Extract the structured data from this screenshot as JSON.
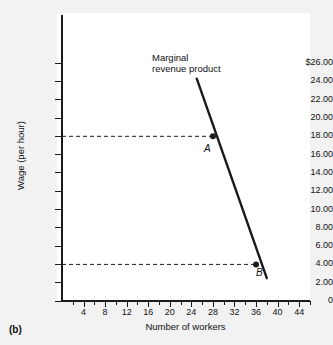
{
  "figure": {
    "caption": "(b)"
  },
  "chart_data": {
    "type": "line",
    "title": "",
    "xlabel": "Number of workers",
    "ylabel": "Wage (per hour)",
    "xlim": [
      0,
      46
    ],
    "ylim": [
      0,
      27
    ],
    "grid": false,
    "legend_position": "inline-annotation",
    "series": [
      {
        "name": "Marginal revenue product",
        "x": [
          25,
          38
        ],
        "y": [
          24.3,
          2.5
        ],
        "color": "#1a1a1a"
      }
    ],
    "points": [
      {
        "label": "A",
        "x": 28,
        "y": 18.0
      },
      {
        "label": "B",
        "x": 36,
        "y": 4.0
      }
    ],
    "annotations": [
      {
        "name": "curve-label",
        "line1": "Marginal",
        "line2": "revenue product"
      }
    ],
    "reference_lines": [
      {
        "name": "wage-18-dashed",
        "orientation": "horizontal",
        "y": 18.0
      },
      {
        "name": "wage-4-dashed",
        "orientation": "horizontal",
        "y": 4.0
      }
    ],
    "y_ticks": [
      {
        "value": 26,
        "label": "$26.00"
      },
      {
        "value": 24,
        "label": "24.00"
      },
      {
        "value": 22,
        "label": "22.00"
      },
      {
        "value": 20,
        "label": "20.00"
      },
      {
        "value": 18,
        "label": "18.00"
      },
      {
        "value": 16,
        "label": "16.00"
      },
      {
        "value": 14,
        "label": "14.00"
      },
      {
        "value": 12,
        "label": "12.00"
      },
      {
        "value": 10,
        "label": "10.00"
      },
      {
        "value": 8,
        "label": "8.00"
      },
      {
        "value": 6,
        "label": "6.00"
      },
      {
        "value": 4,
        "label": "4.00"
      },
      {
        "value": 2,
        "label": "2.00"
      },
      {
        "value": 0,
        "label": "0"
      }
    ],
    "x_ticks_major": [
      {
        "value": 4,
        "label": "4"
      },
      {
        "value": 8,
        "label": "8"
      },
      {
        "value": 12,
        "label": "12"
      },
      {
        "value": 16,
        "label": "16"
      },
      {
        "value": 20,
        "label": "20"
      },
      {
        "value": 24,
        "label": "24"
      },
      {
        "value": 28,
        "label": "28"
      },
      {
        "value": 32,
        "label": "32"
      },
      {
        "value": 36,
        "label": "36"
      },
      {
        "value": 40,
        "label": "40"
      },
      {
        "value": 44,
        "label": "44"
      }
    ],
    "x_ticks_minor": [
      2,
      6,
      10,
      14,
      18,
      22,
      26,
      30,
      34,
      38,
      42,
      46
    ]
  }
}
